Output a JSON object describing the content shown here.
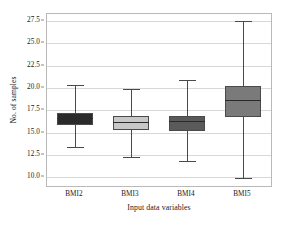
{
  "chart_data": {
    "type": "box",
    "title": "",
    "xlabel": "Input data variables",
    "ylabel": "No. of samples",
    "categories": [
      "BMI2",
      "BMI3",
      "BMI4",
      "BMI5"
    ],
    "ylim": [
      9.0,
      28.3
    ],
    "yticks": [
      10.0,
      12.5,
      15.0,
      17.5,
      20.0,
      22.5,
      25.0,
      27.5
    ],
    "ytick_labels": [
      "10.0",
      "12.5",
      "15.0",
      "17.5",
      "20.0",
      "22.5",
      "25.0",
      "27.5"
    ],
    "grid": true,
    "legend": "none",
    "boxes": [
      {
        "category": "BMI2",
        "whisker_low": 13.4,
        "q1": 15.9,
        "median": 16.6,
        "q3": 17.2,
        "whisker_high": 20.3,
        "fill": "#2b2b2b",
        "edge": "#4a4a4a"
      },
      {
        "category": "BMI3",
        "whisker_low": 12.3,
        "q1": 15.3,
        "median": 16.2,
        "q3": 16.8,
        "whisker_high": 19.9,
        "fill": "#c8c8c8",
        "edge": "#4a4a4a"
      },
      {
        "category": "BMI4",
        "whisker_low": 11.8,
        "q1": 15.2,
        "median": 16.3,
        "q3": 16.8,
        "whisker_high": 20.9,
        "fill": "#5a5a5a",
        "edge": "#4a4a4a"
      },
      {
        "category": "BMI5",
        "whisker_low": 9.9,
        "q1": 16.7,
        "median": 18.6,
        "q3": 20.2,
        "whisker_high": 27.5,
        "fill": "#7a7a7a",
        "edge": "#4a4a4a"
      }
    ]
  }
}
